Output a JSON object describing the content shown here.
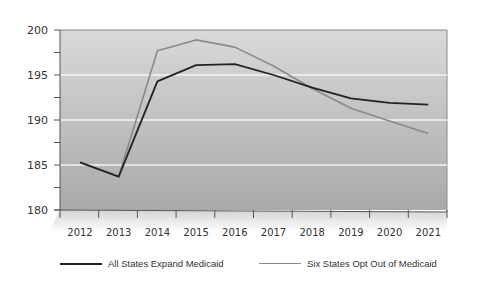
{
  "chart_data": {
    "type": "line",
    "title": "",
    "xlabel": "",
    "ylabel": "",
    "ylim": [
      180,
      200
    ],
    "yticks": [
      180,
      185,
      190,
      195,
      200
    ],
    "categories": [
      "2012",
      "2013",
      "2014",
      "2015",
      "2016",
      "2017",
      "2018",
      "2019",
      "2020",
      "2021"
    ],
    "grid": true,
    "legend_position": "bottom",
    "series": [
      {
        "name": "All States Expand Medicaid",
        "color": "#222222",
        "values": [
          185.3,
          183.7,
          194.3,
          196.1,
          196.2,
          195.0,
          193.6,
          192.4,
          191.9,
          191.7
        ]
      },
      {
        "name": "Six States Opt Out of Medicaid",
        "color": "#8a8a8a",
        "values": [
          185.3,
          183.7,
          197.7,
          198.9,
          198.1,
          196.0,
          193.5,
          191.3,
          189.9,
          188.5
        ]
      }
    ]
  },
  "legend": {
    "items": [
      {
        "label": "All States Expand Medicaid",
        "color": "#222222"
      },
      {
        "label": "Six States Opt Out of Medicaid",
        "color": "#8a8a8a"
      }
    ]
  }
}
